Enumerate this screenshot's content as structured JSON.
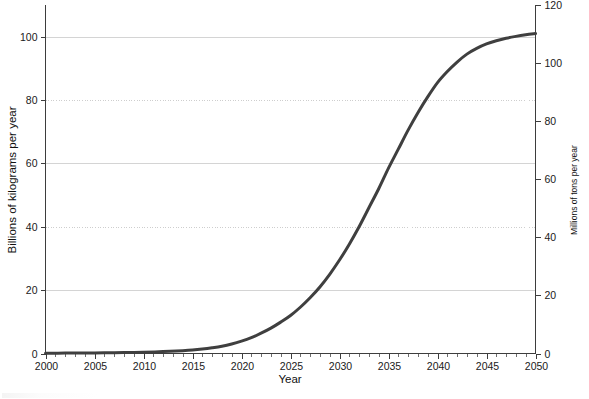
{
  "chart_data": {
    "type": "line",
    "title": "",
    "subtitle": "",
    "xlabel": "Year",
    "ylabel": "Billions of kilograms per year",
    "y2label": "Millions of tons per year",
    "xlim": [
      2000,
      2050
    ],
    "ylim": [
      0,
      110
    ],
    "y2lim": [
      0,
      120
    ],
    "grid": true,
    "legend": null,
    "x_ticks": [
      2000,
      2005,
      2010,
      2015,
      2020,
      2025,
      2030,
      2035,
      2040,
      2045,
      2050
    ],
    "x_tick_labels": [
      "2000",
      "2005",
      "2010",
      "2015",
      "2020",
      "2025",
      "2030",
      "2035",
      "2040",
      "2045",
      "2050"
    ],
    "x_minor_tick_step": 1,
    "y_ticks": [
      0,
      20,
      40,
      60,
      80,
      100
    ],
    "y_tick_labels": [
      "0",
      "20",
      "40",
      "60",
      "80",
      "100"
    ],
    "y2_ticks": [
      0,
      20,
      40,
      60,
      80,
      100,
      120
    ],
    "y2_tick_labels": [
      "0",
      "20",
      "40",
      "60",
      "80",
      "100",
      "120"
    ],
    "series": [
      {
        "name": "Projected annual production",
        "color": "#3f3f3f",
        "line_width": 3,
        "x": [
          2000,
          2002,
          2004,
          2006,
          2008,
          2010,
          2012,
          2014,
          2015,
          2016,
          2017,
          2018,
          2019,
          2020,
          2021,
          2022,
          2023,
          2024,
          2025,
          2026,
          2027,
          2028,
          2029,
          2030,
          2031,
          2032,
          2033,
          2034,
          2035,
          2036,
          2037,
          2038,
          2039,
          2040,
          2041,
          2042,
          2043,
          2044,
          2045,
          2046,
          2047,
          2048,
          2049,
          2050
        ],
        "values": [
          0.1,
          0.12,
          0.15,
          0.2,
          0.3,
          0.4,
          0.6,
          0.9,
          1.1,
          1.4,
          1.8,
          2.3,
          3.0,
          3.9,
          5.0,
          6.4,
          8.0,
          9.9,
          12.0,
          14.6,
          17.6,
          21.0,
          25.0,
          29.5,
          34.5,
          40.0,
          46.0,
          52.0,
          58.5,
          64.5,
          70.5,
          76.0,
          81.0,
          85.5,
          89.0,
          92.0,
          94.5,
          96.3,
          97.7,
          98.7,
          99.5,
          100.1,
          100.6,
          101.0
        ]
      }
    ]
  },
  "axes": {
    "x_axis_label": "Year",
    "y_left_label": "Billions of kilograms per year",
    "y_right_label": "Millions of tons per year"
  }
}
